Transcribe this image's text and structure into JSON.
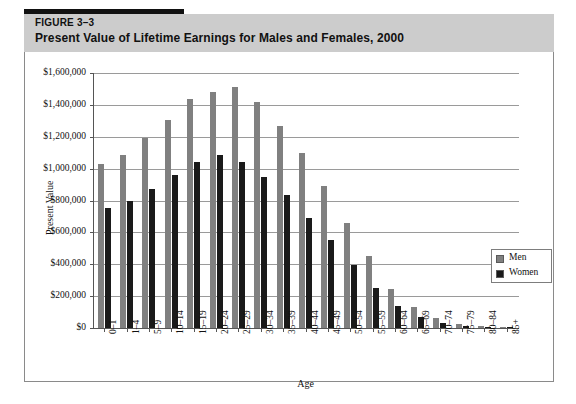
{
  "figure": {
    "label": "FIGURE 3–3",
    "title": "Present Value of Lifetime Earnings for Males and Females, 2000"
  },
  "colors": {
    "men": "#808080",
    "women": "#1a1a1a",
    "header_band": "#cccccc",
    "rule": "#111111",
    "grid": "#9a9a9a",
    "axis": "#555555",
    "plate_border": "#8a8a8a"
  },
  "chart_data": {
    "type": "bar",
    "title": "Present Value of Lifetime Earnings for Males and Females, 2000",
    "xlabel": "Age",
    "ylabel": "Present Value",
    "ylim": [
      0,
      1600000
    ],
    "ytick_step": 200000,
    "ytick_labels": [
      "$0",
      "$200,000",
      "$400,000",
      "$600,000",
      "$800,000",
      "$1,000,000",
      "$1,200,000",
      "$1,400,000",
      "$1,600,000"
    ],
    "ytick_values": [
      0,
      200000,
      400000,
      600000,
      800000,
      1000000,
      1200000,
      1400000,
      1600000
    ],
    "grid": true,
    "legend_position": "right-inside",
    "categories": [
      "0–1",
      "1–4",
      "5–9",
      "10–14",
      "15–19",
      "20–24",
      "25–29",
      "30–34",
      "35–39",
      "40–44",
      "45–49",
      "50–54",
      "55–59",
      "60–64",
      "65–69",
      "70–74",
      "75–79",
      "80–84",
      "85+"
    ],
    "series": [
      {
        "name": "Men",
        "color": "#808080",
        "values": [
          1030000,
          1085000,
          1190000,
          1305000,
          1440000,
          1480000,
          1510000,
          1420000,
          1270000,
          1095000,
          890000,
          660000,
          450000,
          245000,
          130000,
          60000,
          25000,
          10000,
          5000
        ]
      },
      {
        "name": "Women",
        "color": "#1a1a1a",
        "values": [
          755000,
          800000,
          870000,
          960000,
          1040000,
          1085000,
          1040000,
          950000,
          835000,
          690000,
          550000,
          395000,
          250000,
          135000,
          70000,
          30000,
          12000,
          5000,
          2000
        ]
      }
    ]
  },
  "legend": {
    "items": [
      {
        "label": "Men"
      },
      {
        "label": "Women"
      }
    ]
  }
}
